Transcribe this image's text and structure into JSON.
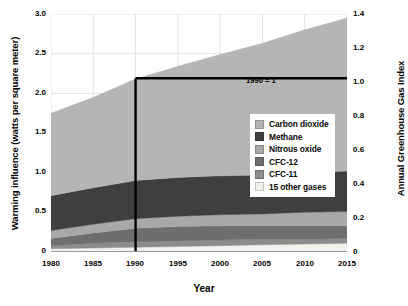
{
  "chart_data": {
    "type": "area",
    "stacked": true,
    "title": "",
    "xlabel": "Year",
    "ylabel": "Warming influence (watts per square meter)",
    "ylabel_right": "Annual Greenhouse Gas Index",
    "xlim": [
      1980,
      2015
    ],
    "ylim": [
      0,
      3.0
    ],
    "ylim_right": [
      0,
      1.4
    ],
    "xticks": [
      "1980",
      "1985",
      "1990",
      "1995",
      "2000",
      "2005",
      "2010",
      "2015"
    ],
    "xtick_values": [
      1980,
      1985,
      1990,
      1995,
      2000,
      2005,
      2010,
      2015
    ],
    "yticks_left": [
      "0",
      "0.5",
      "1.0",
      "1.5",
      "2.0",
      "2.5",
      "3.0"
    ],
    "ytick_values_left": [
      0,
      0.5,
      1.0,
      1.5,
      2.0,
      2.5,
      3.0
    ],
    "yticks_right": [
      "0",
      "0.2",
      "0.4",
      "0.6",
      "0.8",
      "1.0",
      "1.2",
      "1.4"
    ],
    "ytick_values_right": [
      0,
      0.2,
      0.4,
      0.6,
      0.8,
      1.0,
      1.2,
      1.4
    ],
    "grid": true,
    "legend_position": "center-right",
    "x": [
      1980,
      1985,
      1990,
      1995,
      2000,
      2005,
      2010,
      2015
    ],
    "series": [
      {
        "name": "15 other gases",
        "color": "#f2f1ec",
        "stack_order": 1,
        "values": [
          0.04,
          0.05,
          0.06,
          0.07,
          0.08,
          0.09,
          0.1,
          0.11
        ]
      },
      {
        "name": "CFC-11",
        "color": "#8c8c8c",
        "stack_order": 2,
        "values": [
          0.04,
          0.06,
          0.07,
          0.07,
          0.07,
          0.07,
          0.06,
          0.06
        ]
      },
      {
        "name": "CFC-12",
        "color": "#6e6e6e",
        "stack_order": 3,
        "values": [
          0.09,
          0.13,
          0.17,
          0.18,
          0.18,
          0.17,
          0.17,
          0.16
        ]
      },
      {
        "name": "Nitrous oxide",
        "color": "#a8a8a8",
        "stack_order": 4,
        "values": [
          0.1,
          0.11,
          0.12,
          0.13,
          0.14,
          0.15,
          0.17,
          0.18
        ]
      },
      {
        "name": "Methane",
        "color": "#3f3f3f",
        "stack_order": 5,
        "values": [
          0.44,
          0.46,
          0.48,
          0.49,
          0.49,
          0.49,
          0.5,
          0.51
        ]
      },
      {
        "name": "Carbon dioxide",
        "color": "#b5b5b5",
        "stack_order": 6,
        "values": [
          1.04,
          1.14,
          1.28,
          1.4,
          1.53,
          1.66,
          1.8,
          1.93
        ]
      }
    ],
    "totals": [
      1.75,
      1.95,
      2.18,
      2.34,
      2.49,
      2.63,
      2.8,
      2.95
    ],
    "annotations": [
      {
        "text": "1990 = 1",
        "type": "reference-lines",
        "x": 1990,
        "y_left": 2.19,
        "y_right": 1.0
      }
    ]
  },
  "legend": {
    "items": [
      {
        "label": "Carbon dioxide",
        "color": "#b5b5b5"
      },
      {
        "label": "Methane",
        "color": "#3f3f3f"
      },
      {
        "label": "Nitrous oxide",
        "color": "#a8a8a8"
      },
      {
        "label": "CFC-12",
        "color": "#6e6e6e"
      },
      {
        "label": "CFC-11",
        "color": "#8c8c8c"
      },
      {
        "label": "15 other gases",
        "color": "#f2f1ec"
      }
    ]
  }
}
